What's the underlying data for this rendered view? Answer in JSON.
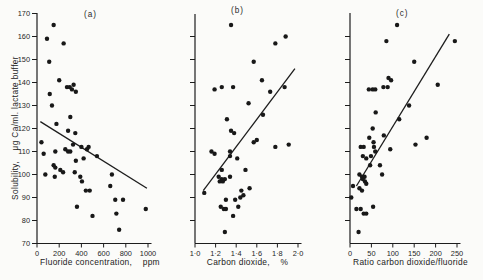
{
  "figure": {
    "y_axis_label": "Solubility,    μg Ca/ml. lactate buffer",
    "background_color": "#fbfbf9",
    "ink_color": "#1d1d1d",
    "y_scale": {
      "top_px": 13.5,
      "px_per_unit": 2.3,
      "y_max": 170
    }
  },
  "chart_data": [
    {
      "type": "scatter",
      "panel_label": "(a)",
      "xlabel": "Fluoride concentration,    ppm",
      "ylabel": "Solubility, μg Ca/ml. lactate buffer",
      "x_range": [
        0,
        1000
      ],
      "ylim": [
        70,
        170
      ],
      "grid": false,
      "x_tick_values": [
        0,
        200,
        400,
        600,
        800,
        1000
      ],
      "x_tick_labels": [
        "0",
        "200",
        "400",
        "600",
        "800",
        "1000"
      ],
      "y_tick_values": [
        70,
        80,
        90,
        100,
        110,
        120,
        130,
        140,
        150,
        160,
        170
      ],
      "y_tick_labels": [
        "70",
        "80",
        "90",
        "100",
        "110",
        "120",
        "130",
        "140",
        "150",
        "160",
        "170"
      ],
      "box": {
        "left": 37,
        "right": 148,
        "axis_top": 13
      },
      "trend_line": {
        "x1": 30,
        "y1": 123,
        "x2": 990,
        "y2": 94
      },
      "points": [
        [
          150,
          165
        ],
        [
          90,
          159
        ],
        [
          240,
          157
        ],
        [
          110,
          149
        ],
        [
          200,
          141
        ],
        [
          330,
          139
        ],
        [
          270,
          138
        ],
        [
          295,
          138
        ],
        [
          315,
          137
        ],
        [
          350,
          136
        ],
        [
          115,
          135
        ],
        [
          135,
          130
        ],
        [
          300,
          125
        ],
        [
          175,
          122
        ],
        [
          280,
          119
        ],
        [
          345,
          118
        ],
        [
          40,
          114
        ],
        [
          325,
          113
        ],
        [
          465,
          112
        ],
        [
          400,
          112
        ],
        [
          450,
          111
        ],
        [
          255,
          111
        ],
        [
          165,
          110
        ],
        [
          280,
          110
        ],
        [
          300,
          110
        ],
        [
          60,
          109
        ],
        [
          540,
          108
        ],
        [
          420,
          107
        ],
        [
          350,
          106
        ],
        [
          150,
          104
        ],
        [
          165,
          103
        ],
        [
          210,
          102
        ],
        [
          235,
          101
        ],
        [
          340,
          101
        ],
        [
          75,
          100
        ],
        [
          160,
          99
        ],
        [
          390,
          99
        ],
        [
          405,
          97
        ],
        [
          440,
          93
        ],
        [
          475,
          93
        ],
        [
          675,
          100
        ],
        [
          660,
          95
        ],
        [
          705,
          89
        ],
        [
          775,
          89
        ],
        [
          360,
          86
        ],
        [
          715,
          83
        ],
        [
          500,
          82
        ],
        [
          980,
          85
        ],
        [
          740,
          76
        ]
      ]
    },
    {
      "type": "scatter",
      "panel_label": "(b)",
      "xlabel": "Carbon dioxide,    %",
      "ylabel": "Solubility, μg Ca/ml. lactate buffer",
      "x_range": [
        1.0,
        2.0
      ],
      "ylim": [
        70,
        170
      ],
      "grid": false,
      "x_tick_values": [
        1.0,
        1.2,
        1.4,
        1.6,
        1.8,
        2.0
      ],
      "x_tick_labels": [
        "1·0",
        "1·2",
        "1·4",
        "1·6",
        "1·8",
        "2·0"
      ],
      "y_tick_values": [
        80,
        90,
        100,
        110,
        120,
        130,
        140,
        150,
        160
      ],
      "y_tick_labels": null,
      "box": {
        "left": 195,
        "right": 298,
        "axis_top": 14
      },
      "trend_line": {
        "x1": 1.08,
        "y1": 93,
        "x2": 1.97,
        "y2": 146
      },
      "points": [
        [
          1.35,
          165
        ],
        [
          1.78,
          157
        ],
        [
          1.88,
          160
        ],
        [
          1.57,
          149
        ],
        [
          1.65,
          141
        ],
        [
          1.87,
          138
        ],
        [
          1.19,
          137
        ],
        [
          1.26,
          138
        ],
        [
          1.37,
          138
        ],
        [
          1.73,
          136
        ],
        [
          1.52,
          131
        ],
        [
          1.66,
          126
        ],
        [
          1.31,
          124
        ],
        [
          1.35,
          119
        ],
        [
          1.38,
          118
        ],
        [
          1.57,
          114
        ],
        [
          1.6,
          115
        ],
        [
          1.34,
          110
        ],
        [
          1.78,
          112
        ],
        [
          1.91,
          113
        ],
        [
          1.16,
          110
        ],
        [
          1.19,
          109
        ],
        [
          1.34,
          108
        ],
        [
          1.41,
          107
        ],
        [
          1.26,
          102
        ],
        [
          1.49,
          102
        ],
        [
          1.23,
          99
        ],
        [
          1.26,
          98
        ],
        [
          1.29,
          98
        ],
        [
          1.24,
          97
        ],
        [
          1.27,
          97
        ],
        [
          1.34,
          99
        ],
        [
          1.45,
          93
        ],
        [
          1.47,
          91
        ],
        [
          1.44,
          90
        ],
        [
          1.53,
          94
        ],
        [
          1.09,
          92
        ],
        [
          1.3,
          89
        ],
        [
          1.39,
          89
        ],
        [
          1.42,
          86
        ],
        [
          1.25,
          86
        ],
        [
          1.28,
          85
        ],
        [
          1.3,
          85
        ],
        [
          1.37,
          82
        ],
        [
          1.29,
          75
        ]
      ]
    },
    {
      "type": "scatter",
      "panel_label": "(c)",
      "xlabel": "Ratio carbon dioxide/fluoride",
      "ylabel": "Solubility, μg Ca/ml. lactate buffer",
      "x_range": [
        0,
        250
      ],
      "ylim": [
        70,
        170
      ],
      "grid": false,
      "x_tick_values": [
        0,
        50,
        100,
        150,
        200,
        250
      ],
      "x_tick_labels": [
        "0",
        "50",
        "100",
        "150",
        "200",
        "250"
      ],
      "y_tick_values": [
        80,
        90,
        100,
        110,
        120,
        130,
        140,
        150,
        160
      ],
      "y_tick_labels": null,
      "box": {
        "left": 350,
        "right": 457,
        "axis_top": 13
      },
      "trend_line": {
        "x1": 15,
        "y1": 95,
        "x2": 232,
        "y2": 161
      },
      "points": [
        [
          110,
          165
        ],
        [
          85,
          158
        ],
        [
          245,
          158
        ],
        [
          150,
          149
        ],
        [
          90,
          142
        ],
        [
          96,
          141
        ],
        [
          78,
          138
        ],
        [
          88,
          138
        ],
        [
          44,
          137
        ],
        [
          53,
          137
        ],
        [
          59,
          137
        ],
        [
          205,
          139
        ],
        [
          138,
          130
        ],
        [
          60,
          127
        ],
        [
          115,
          124
        ],
        [
          53,
          120
        ],
        [
          79,
          117
        ],
        [
          45,
          116
        ],
        [
          25,
          112
        ],
        [
          32,
          112
        ],
        [
          55,
          114
        ],
        [
          56,
          112
        ],
        [
          59,
          110
        ],
        [
          94,
          111
        ],
        [
          153,
          113
        ],
        [
          179,
          116
        ],
        [
          30,
          108
        ],
        [
          38,
          107
        ],
        [
          49,
          108
        ],
        [
          47,
          104
        ],
        [
          70,
          104
        ],
        [
          75,
          100
        ],
        [
          22,
          100
        ],
        [
          28,
          99
        ],
        [
          34,
          99
        ],
        [
          30,
          98
        ],
        [
          35,
          97
        ],
        [
          38,
          96
        ],
        [
          22,
          94
        ],
        [
          28,
          93
        ],
        [
          3,
          90
        ],
        [
          7,
          95
        ],
        [
          54,
          86
        ],
        [
          15,
          85
        ],
        [
          25,
          85
        ],
        [
          32,
          83
        ],
        [
          38,
          83
        ],
        [
          20,
          75
        ]
      ]
    }
  ]
}
